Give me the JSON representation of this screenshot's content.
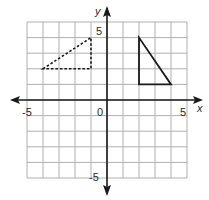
{
  "diagram": {
    "type": "coordinate-plane",
    "grid": {
      "x_min": -5,
      "x_max": 5,
      "y_min": -5,
      "y_max": 5,
      "step": 1,
      "grid_color": "#b0b0b0",
      "axis_color": "#1a1a1a"
    },
    "axes": {
      "x_label": "x",
      "y_label": "y",
      "tick_labels": {
        "x_neg": "-5",
        "x_pos": "5",
        "origin": "0",
        "y_pos": "5",
        "y_neg": "-5"
      }
    },
    "shapes": [
      {
        "name": "dashed-triangle",
        "style": "dashed",
        "vertices": [
          [
            -4,
            2
          ],
          [
            -1,
            4
          ],
          [
            -1,
            2
          ]
        ],
        "color": "#1a1a1a"
      },
      {
        "name": "solid-triangle",
        "style": "solid",
        "vertices": [
          [
            2,
            4
          ],
          [
            2,
            1
          ],
          [
            4,
            1
          ]
        ],
        "color": "#1a1a1a"
      }
    ]
  }
}
